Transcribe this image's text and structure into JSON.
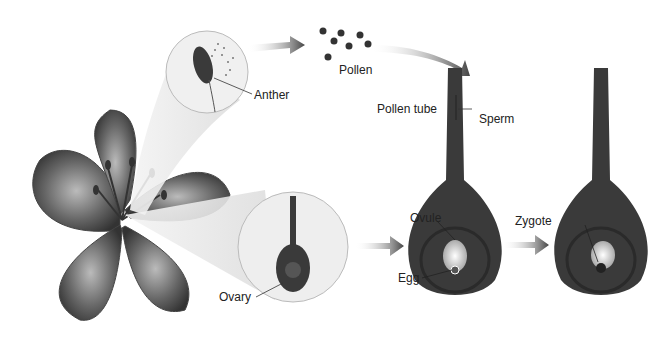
{
  "diagram": {
    "type": "biology-illustration",
    "labels": {
      "anther": "Anther",
      "pollen": "Pollen",
      "pollen_tube": "Pollen tube",
      "sperm": "Sperm",
      "ovule": "Ovule",
      "egg": "Egg",
      "zygote": "Zygote",
      "ovary": "Ovary"
    },
    "stages": [
      {
        "id": "flower",
        "description": "Flower with anthers and ovary"
      },
      {
        "id": "pollination",
        "description": "Pollen travels to stigma, pollen tube grows with sperm"
      },
      {
        "id": "fertilization",
        "description": "Sperm reaches egg inside ovule"
      },
      {
        "id": "zygote",
        "description": "Zygote formed in ovule"
      }
    ],
    "colors": {
      "tissue": "#3a3a3a",
      "arrow": "#555555",
      "background": "#ffffff"
    }
  }
}
